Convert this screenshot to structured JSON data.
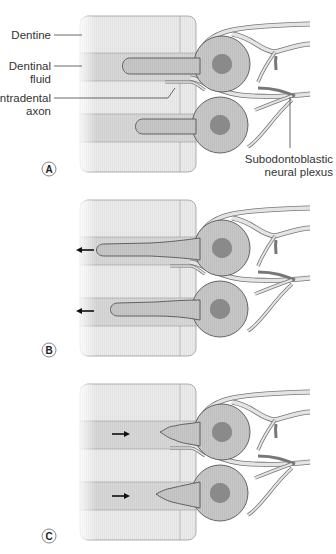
{
  "figure": {
    "panels": [
      {
        "id": "A",
        "label": "A",
        "fluid_flow": "none"
      },
      {
        "id": "B",
        "label": "B",
        "fluid_flow": "outward",
        "arrow": "left"
      },
      {
        "id": "C",
        "label": "C",
        "fluid_flow": "inward",
        "arrow": "right"
      }
    ],
    "labels": {
      "dentine": "Dentine",
      "dentinal_fluid_1": "Dentinal",
      "dentinal_fluid_2": "fluid",
      "intradental_axon_1": "Intradental",
      "intradental_axon_2": "axon",
      "plexus_1": "Subodontoblastic",
      "plexus_2": "neural plexus"
    },
    "colors": {
      "dentine": "#ececec",
      "tubule": "#d6d6d6",
      "cell_body": "#c4c4c4",
      "nucleus": "#8a8a8a",
      "outline": "#555555",
      "nerve_fill": "#e4e4e4",
      "arrow": "#111111"
    }
  }
}
